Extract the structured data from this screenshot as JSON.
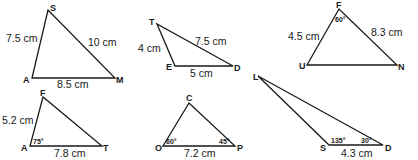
{
  "triangles": [
    {
      "name": "SAM",
      "vertices": {
        "S": [
          48,
          10
        ],
        "A": [
          32,
          78
        ],
        "M": [
          115,
          78
        ]
      },
      "labels": {
        "v1": "S",
        "v2": "A",
        "v3": "M",
        "side_SA": "7.5 cm",
        "side_SM": "10 cm",
        "side_AM": "8.5 cm"
      }
    },
    {
      "name": "TED",
      "vertices": {
        "T": [
          157,
          24
        ],
        "E": [
          175,
          66
        ],
        "D": [
          233,
          66
        ]
      },
      "labels": {
        "v1": "T",
        "v2": "E",
        "v3": "D",
        "side_TE": "4 cm",
        "side_TD": "7.5 cm",
        "side_ED": "5 cm"
      }
    },
    {
      "name": "FUN",
      "vertices": {
        "F": [
          339,
          9
        ],
        "U": [
          307,
          65
        ],
        "N": [
          397,
          65
        ]
      },
      "labels": {
        "v1": "F",
        "v2": "U",
        "v3": "N",
        "side_FU": "4.5 cm",
        "side_FN": "8.3 cm",
        "angle_F": "60°"
      }
    },
    {
      "name": "FAT",
      "vertices": {
        "F": [
          43,
          97
        ],
        "A": [
          30,
          146
        ],
        "T": [
          102,
          146
        ]
      },
      "labels": {
        "v1": "F",
        "v2": "A",
        "v3": "T",
        "side_FA": "5.2 cm",
        "side_AT": "7.8 cm",
        "angle_A": "75°"
      }
    },
    {
      "name": "COP",
      "vertices": {
        "C": [
          189,
          103
        ],
        "O": [
          163,
          146
        ],
        "P": [
          235,
          146
        ]
      },
      "labels": {
        "v1": "C",
        "v2": "O",
        "v3": "P",
        "side_OP": "7.2 cm",
        "angle_O": "60°",
        "angle_P": "45°"
      }
    },
    {
      "name": "LSD",
      "vertices": {
        "L": [
          258,
          76
        ],
        "S": [
          329,
          145
        ],
        "D": [
          383,
          145
        ]
      },
      "labels": {
        "v1": "L",
        "v2": "S",
        "v3": "D",
        "side_SD": "4.3 cm",
        "angle_S": "135°",
        "angle_D": "30°"
      }
    }
  ]
}
